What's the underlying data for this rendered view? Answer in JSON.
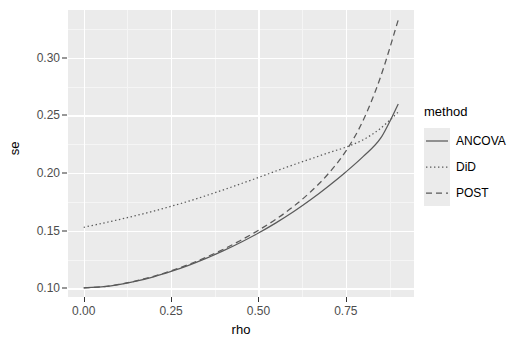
{
  "chart_data": {
    "type": "line",
    "title": "",
    "xlabel": "rho",
    "ylabel": "se",
    "xlim": [
      -0.045,
      0.945
    ],
    "ylim": [
      0.0925,
      0.3415
    ],
    "grid": true,
    "legend": {
      "title": "method",
      "position": "right",
      "entries": [
        {
          "name": "ANCOVA",
          "linetype": "solid",
          "color": "#595959"
        },
        {
          "name": "DiD",
          "linetype": "dotted",
          "color": "#595959"
        },
        {
          "name": "POST",
          "linetype": "dashed",
          "color": "#595959"
        }
      ]
    },
    "x_ticks": [
      {
        "value": 0.0,
        "label": "0.00"
      },
      {
        "value": 0.25,
        "label": "0.25"
      },
      {
        "value": 0.5,
        "label": "0.50"
      },
      {
        "value": 0.75,
        "label": "0.75"
      }
    ],
    "y_ticks": [
      {
        "value": 0.1,
        "label": "0.10"
      },
      {
        "value": 0.15,
        "label": "0.15"
      },
      {
        "value": 0.2,
        "label": "0.20"
      },
      {
        "value": 0.25,
        "label": "0.25"
      },
      {
        "value": 0.3,
        "label": "0.30"
      }
    ],
    "x_minor_ticks": [
      0.125,
      0.375,
      0.625,
      0.875
    ],
    "y_minor_ticks": [
      0.125,
      0.175,
      0.225,
      0.275,
      0.325
    ],
    "x": [
      0.0,
      0.05,
      0.1,
      0.15,
      0.2,
      0.25,
      0.3,
      0.35,
      0.4,
      0.45,
      0.5,
      0.55,
      0.6,
      0.65,
      0.7,
      0.75,
      0.8,
      0.85,
      0.9
    ],
    "series": [
      {
        "name": "ANCOVA",
        "linetype": "solid",
        "values": [
          0.1005,
          0.1012,
          0.1032,
          0.1062,
          0.11,
          0.1147,
          0.12,
          0.126,
          0.1327,
          0.14,
          0.148,
          0.1568,
          0.1664,
          0.177,
          0.1886,
          0.201,
          0.2145,
          0.2305,
          0.26
        ]
      },
      {
        "name": "DiD",
        "linetype": "dotted",
        "values": [
          0.153,
          0.1562,
          0.1596,
          0.1632,
          0.167,
          0.1712,
          0.1756,
          0.1804,
          0.1855,
          0.1908,
          0.1962,
          0.2018,
          0.2072,
          0.2124,
          0.2176,
          0.2225,
          0.229,
          0.239,
          0.253
        ]
      },
      {
        "name": "POST",
        "linetype": "dashed",
        "values": [
          0.1005,
          0.1013,
          0.1034,
          0.1065,
          0.1104,
          0.1152,
          0.1207,
          0.127,
          0.134,
          0.1418,
          0.1504,
          0.16,
          0.171,
          0.184,
          0.1995,
          0.219,
          0.246,
          0.284,
          0.333
        ]
      }
    ]
  }
}
